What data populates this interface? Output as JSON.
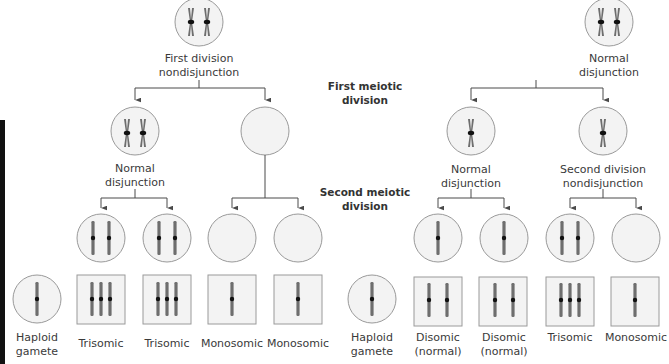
{
  "colors": {
    "cell_fill": "#f3f3f3",
    "cell_stroke": "#9a9a9a",
    "chromosome": "#6e6e6e",
    "centromere": "#111111",
    "line": "#4a4a4a",
    "box_fill": "#f3f3f3",
    "box_stroke": "#9a9a9a"
  },
  "stage_labels": {
    "first_meiotic": [
      "First meiotic",
      "division"
    ],
    "second_meiotic": [
      "Second meiotic",
      "division"
    ]
  },
  "left_tree": {
    "top_label": [
      "First division",
      "nondisjunction"
    ],
    "level2_left_label": [
      "Normal",
      "disjunction"
    ],
    "gametes": [
      "Trisomic",
      "Trisomic",
      "Monosomic",
      "Monosomic"
    ],
    "haploid_label": [
      "Haploid",
      "gamete"
    ]
  },
  "right_tree": {
    "top_label": [
      "Normal",
      "disjunction"
    ],
    "level2_left_label": [
      "Normal",
      "disjunction"
    ],
    "level2_right_label": [
      "Second division",
      "nondisjunction"
    ],
    "gametes": [
      [
        "Disomic",
        "(normal)"
      ],
      [
        "Disomic",
        "(normal)"
      ],
      [
        "Trisomic"
      ],
      [
        "Monosomic"
      ]
    ],
    "haploid_label": [
      "Haploid",
      "gamete"
    ]
  }
}
